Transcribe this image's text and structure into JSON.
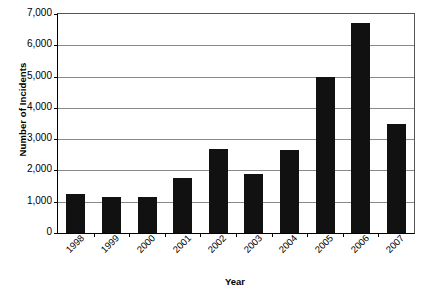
{
  "chart_data": {
    "type": "bar",
    "title": "",
    "xlabel": "Year",
    "ylabel": "Number of Incidents",
    "categories": [
      "1998",
      "1999",
      "2000",
      "2001",
      "2002",
      "2003",
      "2004",
      "2005",
      "2006",
      "2007"
    ],
    "values": [
      1250,
      1150,
      1150,
      1750,
      2700,
      1900,
      2650,
      5000,
      6700,
      3500
    ],
    "ylim": [
      0,
      7000
    ],
    "ytick_labels": [
      "7,000",
      "6,000",
      "5,000",
      "4,000",
      "3,000",
      "2,000",
      "1,000",
      "0"
    ],
    "ytick_values": [
      7000,
      6000,
      5000,
      4000,
      3000,
      2000,
      1000,
      0
    ],
    "ytick_step": 1000,
    "grid": true,
    "legend": false,
    "legend_position": "none",
    "bar_color": "#111111",
    "gridline_color": "#8a8a8a",
    "axis_color": "#000000",
    "background_color": "#ffffff",
    "xtick_rotation": -45,
    "series": [
      {
        "name": "Number of Incidents",
        "values": [
          1250,
          1150,
          1150,
          1750,
          2700,
          1900,
          2650,
          5000,
          6700,
          3500
        ]
      }
    ]
  }
}
